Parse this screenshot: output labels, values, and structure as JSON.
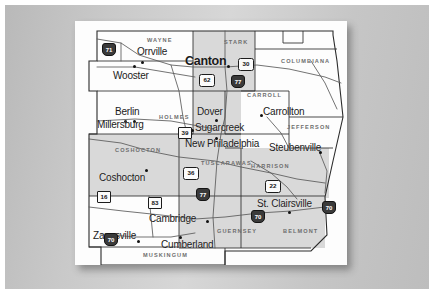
{
  "document": {
    "kind": "scanned-map-slide",
    "title": "Eastern Ohio Counties Regional Map",
    "page_background": "#fdfdfd",
    "slide_background": "#c9c9c9"
  },
  "map": {
    "shaded_fill": "#d8d8d8",
    "unshaded_fill": "#fbfbfb",
    "border_color": "#2a2a2a",
    "road_color": "#555555",
    "cities": [
      {
        "name": "Orrville",
        "x": 62,
        "y": 26,
        "size": "normal",
        "dot_x": 66,
        "dot_y": 40
      },
      {
        "name": "Canton",
        "x": 116,
        "y": 36,
        "size": "big",
        "dot_x": 152,
        "dot_y": 44
      },
      {
        "name": "Wooster",
        "x": 40,
        "y": 50,
        "size": "normal",
        "dot_x": 58,
        "dot_y": 44
      },
      {
        "name": "Berlin",
        "x": 40,
        "y": 87,
        "size": "normal",
        "dot_x": 49,
        "dot_y": 99
      },
      {
        "name": "Millersburg",
        "x": 26,
        "y": 100,
        "size": "normal",
        "dot_x": 58,
        "dot_y": 99
      },
      {
        "name": "Dover",
        "x": 122,
        "y": 86,
        "size": "normal",
        "dot_x": 140,
        "dot_y": 98
      },
      {
        "name": "Sugarcreek",
        "x": 120,
        "y": 104,
        "size": "normal",
        "dot_x": 116,
        "dot_y": 108
      },
      {
        "name": "New Philadelphia",
        "x": 112,
        "y": 120,
        "size": "normal",
        "dot_x": 140,
        "dot_y": 116
      },
      {
        "name": "Carrollton",
        "x": 188,
        "y": 88,
        "size": "normal",
        "dot_x": 185,
        "dot_y": 93
      },
      {
        "name": "Steubenville",
        "x": 196,
        "y": 122,
        "size": "normal",
        "dot_x": 244,
        "dot_y": 130
      },
      {
        "name": "St. Clairsville",
        "x": 186,
        "y": 178,
        "size": "normal",
        "dot_x": 213,
        "dot_y": 190
      },
      {
        "name": "Coshocton",
        "x": 28,
        "y": 153,
        "size": "normal",
        "dot_x": 70,
        "dot_y": 148
      },
      {
        "name": "Cambridge",
        "x": 74,
        "y": 196,
        "size": "normal",
        "dot_x": 131,
        "dot_y": 199
      },
      {
        "name": "Zanesville",
        "x": 22,
        "y": 212,
        "size": "normal",
        "dot_x": 62,
        "dot_y": 219
      },
      {
        "name": "Cumberland",
        "x": 88,
        "y": 221,
        "size": "normal",
        "dot_x": 104,
        "dot_y": 215
      }
    ],
    "counties": [
      {
        "name": "WAYNE",
        "x": 72,
        "y": 17,
        "shaded": false
      },
      {
        "name": "STARK",
        "x": 149,
        "y": 19,
        "shaded": true
      },
      {
        "name": "COLUMBIANA",
        "x": 218,
        "y": 38,
        "shaded": false
      },
      {
        "name": "HOLMES",
        "x": 84,
        "y": 94,
        "shaded": false
      },
      {
        "name": "CARROLL",
        "x": 175,
        "y": 72,
        "shaded": false
      },
      {
        "name": "JEFFERSON",
        "x": 216,
        "y": 104,
        "shaded": false
      },
      {
        "name": "COSHOCTON",
        "x": 46,
        "y": 127,
        "shaded": true
      },
      {
        "name": "TUSCARAWAS",
        "x": 133,
        "y": 140,
        "shaded": true
      },
      {
        "name": "HARRISON",
        "x": 180,
        "y": 143,
        "shaded": true
      },
      {
        "name": "GUERNSEY",
        "x": 148,
        "y": 208,
        "shaded": true
      },
      {
        "name": "BELMONT",
        "x": 213,
        "y": 208,
        "shaded": true
      },
      {
        "name": "MUSKINGUM",
        "x": 74,
        "y": 244,
        "shaded": false
      }
    ],
    "highway_shields": [
      {
        "label": "71",
        "type": "interstate",
        "x": 27,
        "y": 22
      },
      {
        "label": "62",
        "type": "us",
        "x": 127,
        "y": 53
      },
      {
        "label": "77",
        "type": "interstate",
        "x": 156,
        "y": 54
      },
      {
        "label": "30",
        "type": "us",
        "x": 165,
        "y": 37
      },
      {
        "label": "39",
        "type": "state",
        "x": 106,
        "y": 107
      },
      {
        "label": "36",
        "type": "us",
        "x": 110,
        "y": 147
      },
      {
        "label": "22",
        "type": "us",
        "x": 192,
        "y": 160
      },
      {
        "label": "77",
        "type": "interstate",
        "x": 121,
        "y": 168
      },
      {
        "label": "16",
        "type": "state",
        "x": 25,
        "y": 171
      },
      {
        "label": "83",
        "type": "state",
        "x": 75,
        "y": 177
      },
      {
        "label": "70",
        "type": "interstate",
        "x": 30,
        "y": 213
      },
      {
        "label": "70",
        "type": "interstate",
        "x": 178,
        "y": 190
      },
      {
        "label": "70",
        "type": "interstate",
        "x": 249,
        "y": 181
      }
    ]
  }
}
